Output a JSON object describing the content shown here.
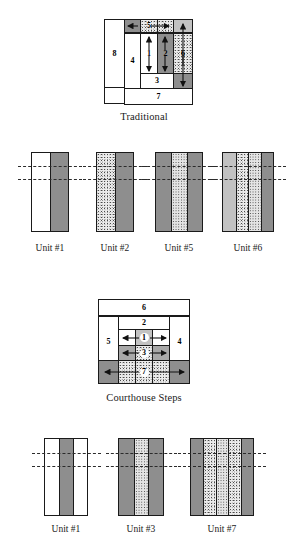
{
  "figure": {
    "blocks": [
      {
        "id": "traditional",
        "caption": "Traditional",
        "cells": [
          {
            "label": "8",
            "fabric": "white",
            "arrow": "none"
          },
          {
            "label": "4",
            "fabric": "white",
            "arrow": "none"
          },
          {
            "label": "5",
            "fabric": "stipple",
            "arrow": "right"
          },
          {
            "label": "1",
            "fabric": "white",
            "arrow": "updown"
          },
          {
            "label": "2",
            "fabric": "dark",
            "arrow": "updown"
          },
          {
            "label": "6",
            "fabric": "stipple",
            "arrow": "updown"
          },
          {
            "label": "3",
            "fabric": "white",
            "arrow": "none"
          },
          {
            "label": "7",
            "fabric": "white",
            "arrow": "none"
          }
        ]
      },
      {
        "id": "courthouse-steps",
        "caption": "Courthouse Steps",
        "cells": [
          {
            "label": "6",
            "fabric": "white",
            "arrow": "none"
          },
          {
            "label": "2",
            "fabric": "white",
            "arrow": "none"
          },
          {
            "label": "5",
            "fabric": "white",
            "arrow": "none"
          },
          {
            "label": "1",
            "fabric": "light",
            "arrow": "leftright"
          },
          {
            "label": "4",
            "fabric": "white",
            "arrow": "none"
          },
          {
            "label": "3",
            "fabric": "stipple",
            "arrow": "leftright"
          },
          {
            "label": "7",
            "fabric": "stipple",
            "arrow": "leftright"
          }
        ]
      }
    ],
    "unit_rows": [
      {
        "row_id": "traditional-units",
        "units": [
          {
            "label": "Unit #1",
            "strips": [
              "white",
              "dark"
            ]
          },
          {
            "label": "Unit #2",
            "strips": [
              "stipple",
              "dark"
            ]
          },
          {
            "label": "Unit #5",
            "strips": [
              "dark",
              "stipple",
              "dark"
            ]
          },
          {
            "label": "Unit #6",
            "strips": [
              "light",
              "stipple",
              "stipple",
              "dark"
            ]
          }
        ]
      },
      {
        "row_id": "courthouse-units",
        "units": [
          {
            "label": "Unit #1",
            "strips": [
              "white",
              "dark",
              "white"
            ]
          },
          {
            "label": "Unit #3",
            "strips": [
              "dark",
              "stipple",
              "dark"
            ]
          },
          {
            "label": "Unit #7",
            "strips": [
              "dark",
              "stipple",
              "stipple",
              "stipple",
              "dark"
            ]
          }
        ]
      }
    ],
    "cut_lines_per_unit": 2
  }
}
